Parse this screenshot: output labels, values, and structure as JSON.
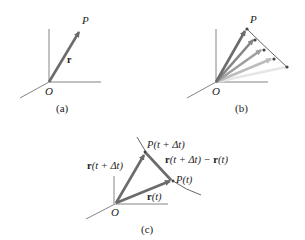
{
  "panels": {
    "a": {
      "caption": "(a)",
      "origin_label": "O",
      "point_label": "P",
      "vector_label": "r"
    },
    "b": {
      "caption": "(b)",
      "origin_label": "O",
      "point_label": "P",
      "vector_count": 5
    },
    "c": {
      "caption": "(c)",
      "origin_label": "O",
      "label_p_t_dt": "P(t + Δt)",
      "label_p_t": "P(t)",
      "label_r_t_dt_bold": "r",
      "label_r_t_dt_rest": "(t + Δt)",
      "label_r_t_bold": "r",
      "label_r_t_rest": "(t)",
      "label_diff_bold1": "r",
      "label_diff_mid": "(t + Δt) − ",
      "label_diff_bold2": "r",
      "label_diff_rest": "(t)"
    }
  },
  "colors": {
    "axis": "#666666",
    "vector": "#6b6b6b",
    "text": "#222222"
  }
}
